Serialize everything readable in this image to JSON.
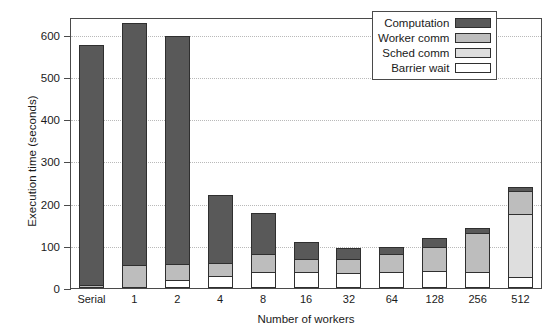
{
  "chart": {
    "type": "bar",
    "ylabel": "Execution time (seconds)",
    "xlabel": "Number of workers"
  },
  "axes": {
    "y_ticks": [
      "0",
      "100",
      "200",
      "300",
      "400",
      "500",
      "600"
    ],
    "x_ticks": [
      "Serial",
      "1",
      "2",
      "4",
      "8",
      "16",
      "32",
      "64",
      "128",
      "256",
      "512"
    ]
  },
  "legend": {
    "items": [
      {
        "label": "Computation",
        "color": "#595959"
      },
      {
        "label": "Worker comm",
        "color": "#bdbdbd"
      },
      {
        "label": "Sched comm",
        "color": "#dedede"
      },
      {
        "label": "Barrier wait",
        "color": "#ffffff"
      }
    ]
  },
  "chart_data": {
    "type": "bar",
    "stacked": true,
    "title": "",
    "xlabel": "Number of workers",
    "ylabel": "Execution time (seconds)",
    "ylim": [
      0,
      640
    ],
    "ytick_values": [
      0,
      100,
      200,
      300,
      400,
      500,
      600
    ],
    "grid": "horizontal-dotted",
    "legend_position": "top-right",
    "stack_order_bottom_to_top": [
      "Barrier wait",
      "Sched comm",
      "Worker comm",
      "Computation"
    ],
    "categories": [
      "Serial",
      "1",
      "2",
      "4",
      "8",
      "16",
      "32",
      "64",
      "128",
      "256",
      "512"
    ],
    "series": [
      {
        "name": "Barrier wait",
        "color": "#ffffff",
        "values": [
          0,
          0,
          18,
          28,
          38,
          38,
          35,
          38,
          40,
          38,
          25
        ]
      },
      {
        "name": "Sched comm",
        "color": "#dedede",
        "values": [
          0,
          0,
          0,
          0,
          0,
          0,
          0,
          0,
          0,
          0,
          150
        ]
      },
      {
        "name": "Worker comm",
        "color": "#bdbdbd",
        "values": [
          8,
          55,
          38,
          32,
          42,
          30,
          33,
          42,
          58,
          92,
          55
        ]
      },
      {
        "name": "Computation",
        "color": "#595959",
        "values": [
          568,
          573,
          541,
          160,
          98,
          42,
          26,
          17,
          20,
          13,
          10
        ]
      }
    ],
    "totals": [
      576,
      628,
      597,
      220,
      178,
      110,
      94,
      97,
      118,
      143,
      240
    ]
  },
  "bars": [
    {
      "category": "Serial",
      "total": 576,
      "segments": [
        {
          "series": "Barrier wait",
          "value": 0,
          "color": "#ffffff"
        },
        {
          "series": "Sched comm",
          "value": 0,
          "color": "#dedede"
        },
        {
          "series": "Worker comm",
          "value": 8,
          "color": "#bdbdbd"
        },
        {
          "series": "Computation",
          "value": 568,
          "color": "#595959"
        }
      ]
    },
    {
      "category": "1",
      "total": 628,
      "segments": [
        {
          "series": "Barrier wait",
          "value": 0,
          "color": "#ffffff"
        },
        {
          "series": "Sched comm",
          "value": 0,
          "color": "#dedede"
        },
        {
          "series": "Worker comm",
          "value": 55,
          "color": "#bdbdbd"
        },
        {
          "series": "Computation",
          "value": 573,
          "color": "#595959"
        }
      ]
    },
    {
      "category": "2",
      "total": 597,
      "segments": [
        {
          "series": "Barrier wait",
          "value": 18,
          "color": "#ffffff"
        },
        {
          "series": "Sched comm",
          "value": 0,
          "color": "#dedede"
        },
        {
          "series": "Worker comm",
          "value": 38,
          "color": "#bdbdbd"
        },
        {
          "series": "Computation",
          "value": 541,
          "color": "#595959"
        }
      ]
    },
    {
      "category": "4",
      "total": 220,
      "segments": [
        {
          "series": "Barrier wait",
          "value": 28,
          "color": "#ffffff"
        },
        {
          "series": "Sched comm",
          "value": 0,
          "color": "#dedede"
        },
        {
          "series": "Worker comm",
          "value": 32,
          "color": "#bdbdbd"
        },
        {
          "series": "Computation",
          "value": 160,
          "color": "#595959"
        }
      ]
    },
    {
      "category": "8",
      "total": 178,
      "segments": [
        {
          "series": "Barrier wait",
          "value": 38,
          "color": "#ffffff"
        },
        {
          "series": "Sched comm",
          "value": 0,
          "color": "#dedede"
        },
        {
          "series": "Worker comm",
          "value": 42,
          "color": "#bdbdbd"
        },
        {
          "series": "Computation",
          "value": 98,
          "color": "#595959"
        }
      ]
    },
    {
      "category": "16",
      "total": 110,
      "segments": [
        {
          "series": "Barrier wait",
          "value": 38,
          "color": "#ffffff"
        },
        {
          "series": "Sched comm",
          "value": 0,
          "color": "#dedede"
        },
        {
          "series": "Worker comm",
          "value": 30,
          "color": "#bdbdbd"
        },
        {
          "series": "Computation",
          "value": 42,
          "color": "#595959"
        }
      ]
    },
    {
      "category": "32",
      "total": 94,
      "segments": [
        {
          "series": "Barrier wait",
          "value": 35,
          "color": "#ffffff"
        },
        {
          "series": "Sched comm",
          "value": 0,
          "color": "#dedede"
        },
        {
          "series": "Worker comm",
          "value": 33,
          "color": "#bdbdbd"
        },
        {
          "series": "Computation",
          "value": 26,
          "color": "#595959"
        }
      ]
    },
    {
      "category": "64",
      "total": 97,
      "segments": [
        {
          "series": "Barrier wait",
          "value": 38,
          "color": "#ffffff"
        },
        {
          "series": "Sched comm",
          "value": 0,
          "color": "#dedede"
        },
        {
          "series": "Worker comm",
          "value": 42,
          "color": "#bdbdbd"
        },
        {
          "series": "Computation",
          "value": 17,
          "color": "#595959"
        }
      ]
    },
    {
      "category": "128",
      "total": 118,
      "segments": [
        {
          "series": "Barrier wait",
          "value": 40,
          "color": "#ffffff"
        },
        {
          "series": "Sched comm",
          "value": 0,
          "color": "#dedede"
        },
        {
          "series": "Worker comm",
          "value": 58,
          "color": "#bdbdbd"
        },
        {
          "series": "Computation",
          "value": 20,
          "color": "#595959"
        }
      ]
    },
    {
      "category": "256",
      "total": 143,
      "segments": [
        {
          "series": "Barrier wait",
          "value": 38,
          "color": "#ffffff"
        },
        {
          "series": "Sched comm",
          "value": 0,
          "color": "#dedede"
        },
        {
          "series": "Worker comm",
          "value": 92,
          "color": "#bdbdbd"
        },
        {
          "series": "Computation",
          "value": 13,
          "color": "#595959"
        }
      ]
    },
    {
      "category": "512",
      "total": 240,
      "segments": [
        {
          "series": "Barrier wait",
          "value": 25,
          "color": "#ffffff"
        },
        {
          "series": "Sched comm",
          "value": 150,
          "color": "#dedede"
        },
        {
          "series": "Worker comm",
          "value": 55,
          "color": "#bdbdbd"
        },
        {
          "series": "Computation",
          "value": 10,
          "color": "#595959"
        }
      ]
    }
  ]
}
